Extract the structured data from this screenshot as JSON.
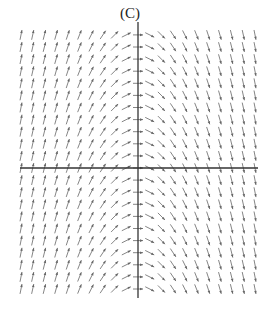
{
  "chart_data": {
    "type": "slope_field",
    "title": "(C)",
    "equation": "dy/dx = -x",
    "xlabel": "",
    "ylabel": "",
    "xlim": [
      -5,
      5
    ],
    "ylim": [
      -5.5,
      5.5
    ],
    "x_samples": [
      -5,
      -4.5,
      -4,
      -3.5,
      -3,
      -2.5,
      -2,
      -1.5,
      -1,
      -0.5,
      0,
      0.5,
      1,
      1.5,
      2,
      2.5,
      3,
      3.5,
      4,
      4.5,
      5
    ],
    "y_samples": [
      -5,
      -4.5,
      -4,
      -3.5,
      -3,
      -2.5,
      -2,
      -1.5,
      -1,
      -0.5,
      0,
      0.5,
      1,
      1.5,
      2,
      2.5,
      3,
      3.5,
      4,
      4.5,
      5,
      5.5
    ],
    "grid": false,
    "axes_visible": true,
    "tick_labels": false,
    "colors": {
      "axis": "#333333",
      "arrow": "#777777"
    }
  }
}
